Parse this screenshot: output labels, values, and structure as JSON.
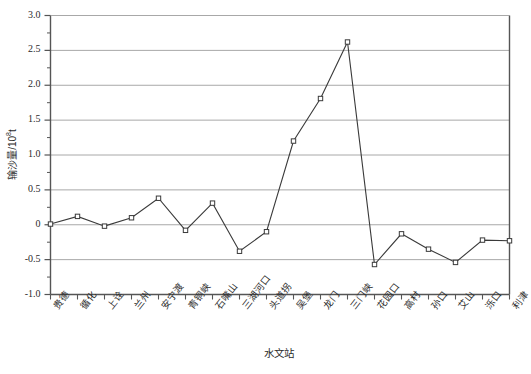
{
  "chart_data": {
    "type": "line",
    "title": "",
    "xlabel": "水文站",
    "ylabel": "输沙量/10⁸t",
    "ylabel_base": "输沙量/10",
    "ylabel_exp": "8",
    "ylabel_unit": "t",
    "ylim": [
      -1.0,
      3.0
    ],
    "ytick_labels": [
      "3.0",
      "2.5",
      "2.0",
      "1.5",
      "1.0",
      "0.5",
      "0",
      "-0.5",
      "-1.0"
    ],
    "ytick_values": [
      3.0,
      2.5,
      2.0,
      1.5,
      1.0,
      0.5,
      0,
      -0.5,
      -1.0
    ],
    "grid": "horizontal",
    "legend": "none",
    "marker": "open-square",
    "line_color": "#3a3a3a",
    "grid_color": "#a8a8a8",
    "axis_color": "#555555",
    "categories": [
      "贵德",
      "循化",
      "上诠",
      "兰州",
      "安宁渡",
      "青铜峡",
      "石嘴山",
      "三湖河口",
      "头道拐",
      "吴堡",
      "龙门",
      "三门峡",
      "花园口",
      "高村",
      "孙口",
      "艾山",
      "泺口",
      "利津"
    ],
    "values": [
      0.01,
      0.12,
      -0.02,
      0.1,
      0.38,
      -0.08,
      0.31,
      -0.38,
      -0.1,
      1.2,
      1.81,
      2.62,
      -0.57,
      -0.13,
      -0.35,
      -0.54,
      -0.22,
      -0.23
    ]
  }
}
